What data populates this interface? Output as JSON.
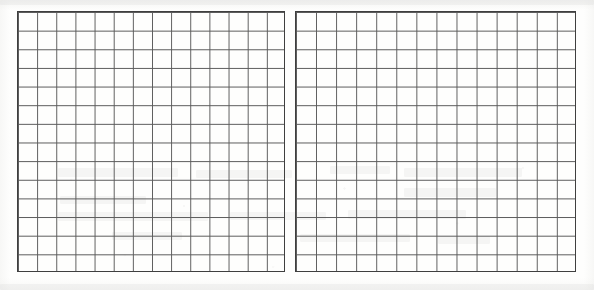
{
  "document": {
    "kind": "scanned-grid-paper-spread",
    "page_label": "",
    "visible_text": "",
    "background_color": "#fefefd",
    "paper_tint": "#f7f7f5"
  },
  "grid": {
    "line_color": "#4a4a4a",
    "minor_line_color": "#5a5a5a",
    "border_color": "#3f3f3f",
    "line_width_px": 1,
    "cell_width_px": 19.2,
    "cell_height_px": 18.7,
    "columns_per_block": 14,
    "rows_per_block": 14,
    "blocks": 2,
    "gutter_width_px": 10,
    "spread_left_px": 17,
    "spread_top_px": 11,
    "spread_width_px": 559,
    "spread_height_px": 261
  },
  "blocks": [
    {
      "id": "left-page",
      "name": "left-grid-page",
      "columns": 14,
      "rows": 14,
      "width_px": 268,
      "height_px": 261,
      "content": ""
    },
    {
      "id": "right-page",
      "name": "right-grid-page",
      "columns": 14,
      "rows": 14,
      "width_px": 281,
      "height_px": 261,
      "content": ""
    }
  ],
  "artifacts": [
    {
      "x": 58,
      "y": 168,
      "w": 120,
      "h": 9
    },
    {
      "x": 196,
      "y": 170,
      "w": 96,
      "h": 8
    },
    {
      "x": 330,
      "y": 166,
      "w": 60,
      "h": 8
    },
    {
      "x": 404,
      "y": 168,
      "w": 118,
      "h": 9
    },
    {
      "x": 60,
      "y": 196,
      "w": 86,
      "h": 8
    },
    {
      "x": 404,
      "y": 188,
      "w": 92,
      "h": 9
    },
    {
      "x": 58,
      "y": 212,
      "w": 150,
      "h": 9
    },
    {
      "x": 230,
      "y": 212,
      "w": 96,
      "h": 8
    },
    {
      "x": 348,
      "y": 210,
      "w": 118,
      "h": 9
    },
    {
      "x": 112,
      "y": 232,
      "w": 70,
      "h": 8
    },
    {
      "x": 300,
      "y": 234,
      "w": 110,
      "h": 8
    },
    {
      "x": 438,
      "y": 236,
      "w": 52,
      "h": 8
    },
    {
      "x": 0,
      "y": 0,
      "w": 594,
      "h": 5
    },
    {
      "x": 0,
      "y": 284,
      "w": 594,
      "h": 6
    }
  ]
}
